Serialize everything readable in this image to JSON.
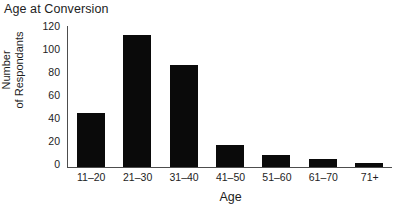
{
  "chart_data": {
    "type": "bar",
    "title": "Age at Conversion",
    "xlabel": "Age",
    "ylabel": "Number of Respondants",
    "ylabel_lines": [
      "Number",
      "of Respondants"
    ],
    "categories": [
      "11–20",
      "21–30",
      "31–40",
      "41–50",
      "51–60",
      "61–70",
      "71+"
    ],
    "values": [
      46,
      112,
      87,
      19,
      10,
      7,
      3
    ],
    "yticks": [
      120,
      100,
      80,
      60,
      40,
      20,
      0
    ],
    "ylim": [
      0,
      120
    ],
    "grid": false,
    "legend": null,
    "bar_color": "#0a0a0a",
    "background_color": "#ffffff",
    "axis_color": "#4d4d4d"
  }
}
